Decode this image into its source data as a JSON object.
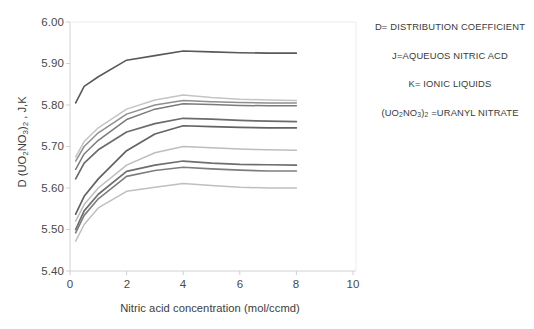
{
  "chart_data": {
    "type": "line",
    "title": "",
    "xlabel": "Nitric acid concentration (mol/ccmd)",
    "ylabel": "D (UO2NO3)2 , J,K",
    "ylabel_parts": {
      "prefix": "D (UO",
      "sub1": "2",
      "mid": "NO",
      "sub2": "3",
      "close": ")",
      "sub3": "2",
      "suffix": " , J,K"
    },
    "xlim": [
      0,
      10
    ],
    "ylim": [
      5.4,
      6.0
    ],
    "xticks": [
      0,
      2,
      4,
      6,
      8,
      10
    ],
    "yticks": [
      "5.40",
      "5.50",
      "5.60",
      "5.70",
      "5.80",
      "5.90",
      "6.00"
    ],
    "grid": false,
    "legend_position": "none",
    "x": [
      0.2,
      0.5,
      1.0,
      2.0,
      3.0,
      4.0,
      5.0,
      6.0,
      7.0,
      8.0
    ],
    "series": [
      {
        "name": "series-1",
        "color": "#595959",
        "width": 1.6,
        "values": [
          5.805,
          5.845,
          5.868,
          5.908,
          5.919,
          5.93,
          5.928,
          5.926,
          5.925,
          5.925
        ]
      },
      {
        "name": "series-2",
        "color": "#c4c4c4",
        "width": 1.5,
        "values": [
          5.675,
          5.712,
          5.745,
          5.79,
          5.812,
          5.824,
          5.818,
          5.814,
          5.812,
          5.811
        ]
      },
      {
        "name": "series-3",
        "color": "#8f8f8f",
        "width": 1.5,
        "values": [
          5.665,
          5.7,
          5.733,
          5.778,
          5.8,
          5.811,
          5.808,
          5.806,
          5.805,
          5.805
        ]
      },
      {
        "name": "series-4",
        "color": "#7a7a7a",
        "width": 1.5,
        "values": [
          5.645,
          5.682,
          5.715,
          5.765,
          5.79,
          5.803,
          5.801,
          5.799,
          5.798,
          5.798
        ]
      },
      {
        "name": "series-5",
        "color": "#6b6b6b",
        "width": 1.7,
        "values": [
          5.622,
          5.66,
          5.692,
          5.735,
          5.755,
          5.768,
          5.766,
          5.763,
          5.761,
          5.76
        ]
      },
      {
        "name": "series-6",
        "color": "#636363",
        "width": 1.7,
        "values": [
          5.537,
          5.58,
          5.622,
          5.69,
          5.73,
          5.75,
          5.748,
          5.746,
          5.745,
          5.745
        ]
      },
      {
        "name": "series-7",
        "color": "#bdbdbd",
        "width": 1.5,
        "values": [
          5.52,
          5.56,
          5.6,
          5.655,
          5.685,
          5.7,
          5.697,
          5.694,
          5.692,
          5.691
        ]
      },
      {
        "name": "series-8",
        "color": "#6e6e6e",
        "width": 1.7,
        "values": [
          5.5,
          5.545,
          5.585,
          5.64,
          5.655,
          5.665,
          5.66,
          5.657,
          5.656,
          5.655
        ]
      },
      {
        "name": "series-9",
        "color": "#7d7d7d",
        "width": 1.6,
        "values": [
          5.492,
          5.534,
          5.574,
          5.628,
          5.642,
          5.65,
          5.646,
          5.643,
          5.641,
          5.641
        ]
      },
      {
        "name": "series-10",
        "color": "#bfbfbf",
        "width": 1.5,
        "values": [
          5.472,
          5.512,
          5.552,
          5.592,
          5.602,
          5.611,
          5.606,
          5.602,
          5.6,
          5.6
        ]
      }
    ],
    "annotations": [
      "D= DISTRIBUTION COEFFICIENT",
      "J=AQUEUOS NITRIC ACD",
      "K= IONIC LIQUIDS",
      "(UO2NO3)2 =URANYL NITRATE"
    ]
  },
  "notes": {
    "line1": "D= DISTRIBUTION COEFFICIENT",
    "line2": "J=AQUEUOS NITRIC ACD",
    "line3": "K= IONIC LIQUIDS",
    "line4_prefix": "(UO",
    "line4_sub1": "2",
    "line4_mid": "NO",
    "line4_sub2": "3",
    "line4_close": ")",
    "line4_sub3": "2",
    "line4_suffix": " =URANYL NITRATE"
  },
  "axes": {
    "x_title": "Nitric acid concentration (mol/ccmd)",
    "y_labels": [
      "6.00",
      "5.90",
      "5.80",
      "5.70",
      "5.60",
      "5.50",
      "5.40"
    ],
    "x_labels": [
      "0",
      "2",
      "4",
      "6",
      "8",
      "10"
    ]
  }
}
